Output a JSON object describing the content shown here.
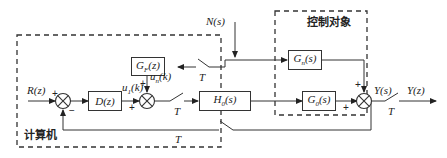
{
  "diagram": {
    "type": "block-diagram",
    "regions": {
      "computer": {
        "label": "计算机"
      },
      "plant": {
        "label": "控制对象"
      }
    },
    "blocks": {
      "D": {
        "label": "D(z)"
      },
      "GF": {
        "label": "G_F(z)",
        "main": "G",
        "sub": "F",
        "arg": "(z)"
      },
      "H0": {
        "label": "H_0(s)",
        "main": "H",
        "sub": "0",
        "arg": "(s)"
      },
      "Gn": {
        "label": "G_n(s)",
        "main": "G",
        "sub": "n",
        "arg": "(s)"
      },
      "G0": {
        "label": "G_0(s)",
        "main": "G",
        "sub": "0",
        "arg": "(s)"
      }
    },
    "signals": {
      "R": "R(z)",
      "N": "N(s)",
      "u1_main": "u",
      "u1_sub": "1",
      "u1_arg": "(k)",
      "un_main": "u",
      "un_sub": "n",
      "un_arg": "(k)",
      "Ys": "Y(s)",
      "Yz": "Y(z)"
    },
    "samplers": {
      "T1": "T",
      "T2": "T",
      "T3": "T",
      "T4": "T"
    },
    "signs": {
      "sum1_plus": "+",
      "sum1_minus": "−",
      "sum2_plus_left": "+",
      "sum2_plus_top": "+",
      "sum3_plus_left": "+",
      "sum3_plus_top": "+"
    }
  }
}
